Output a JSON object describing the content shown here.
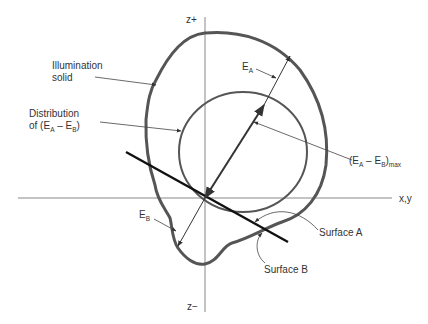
{
  "axes": {
    "z_plus": "z+",
    "z_minus": "z−",
    "xy": "x,y"
  },
  "labels": {
    "illumination_solid_1": "Illumination",
    "illumination_solid_2": "solid",
    "distribution_1": "Distribution",
    "distribution_2_pre": "of (E",
    "distribution_2_sub_a": "A",
    "distribution_2_mid": " – E",
    "distribution_2_sub_b": "B",
    "distribution_2_post": ")",
    "ea": "E",
    "ea_sub": "A",
    "eb": "E",
    "eb_sub": "B",
    "max_pre": "(E",
    "max_sub_a": "A",
    "max_mid": " – E",
    "max_sub_b": "B",
    "max_post": ")",
    "max_sub": "max",
    "surface_a": "Surface A",
    "surface_b": "Surface B"
  },
  "colors": {
    "solid_curve": "#555555",
    "surface_line": "#111111",
    "axis": "#777777",
    "leader": "#444444"
  }
}
